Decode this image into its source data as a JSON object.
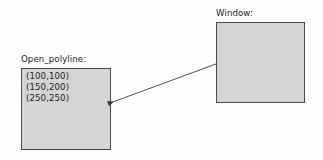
{
  "diagram": {
    "background_color": "#fefefe",
    "box_fill_color": "#d5d5d5",
    "box_border_color": "#4a4a4a",
    "text_color": "#1b1b1b",
    "arrow_color": "#3c3c3c"
  },
  "polyline_object": {
    "label": "Open_polyline:",
    "points": [
      "(100,100)",
      "(150,200)",
      "(250,250)"
    ]
  },
  "window_object": {
    "label": "Window:",
    "contents": ""
  },
  "arrow": {
    "name": "window-to-polyline-arrow",
    "from_x": 216,
    "from_y": 64,
    "to_x": 110,
    "to_y": 103,
    "direction": "window-to-open_polyline"
  }
}
